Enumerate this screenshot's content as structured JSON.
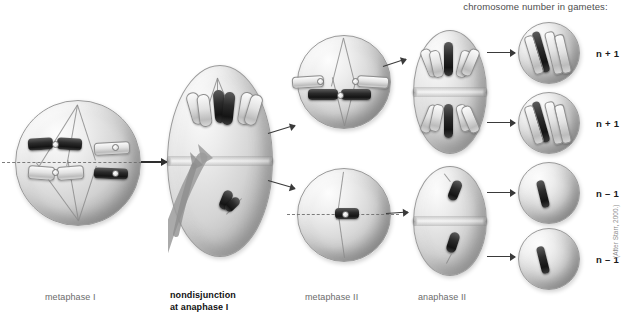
{
  "figure": {
    "header": "chromosome number in gametes:",
    "credit": "(After Starr, 2000.)"
  },
  "captions": {
    "metaphase_1": "metaphase I",
    "nondisjunction_line1": "nondisjunction",
    "nondisjunction_line2": "at anaphase I",
    "metaphase_2": "metaphase II",
    "anaphase_2": "anaphase II"
  },
  "gamete_labels": [
    {
      "id": "gamete-1",
      "label": "n + 1",
      "chromosomes": 3
    },
    {
      "id": "gamete-2",
      "label": "n + 1",
      "chromosomes": 3
    },
    {
      "id": "gamete-3",
      "label": "n – 1",
      "chromosomes": 1
    },
    {
      "id": "gamete-4",
      "label": "n – 1",
      "chromosomes": 1
    }
  ],
  "colors": {
    "chromosome_dark": "#1c1c1c",
    "chromosome_light": "#e2e2e2",
    "cell_fill": "#d2d2d2",
    "background": "#ffffff",
    "caption_text": "#6b6b6b",
    "emphasis_text": "#111111"
  }
}
